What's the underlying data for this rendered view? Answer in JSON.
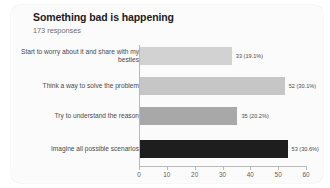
{
  "card": {
    "title": "Something bad is happening",
    "subtitle": "173 responses"
  },
  "chart_data": {
    "type": "bar",
    "orientation": "horizontal",
    "title": "Something bad is happening",
    "subtitle": "173 responses",
    "xlabel": "",
    "ylabel": "",
    "xlim": [
      0,
      60
    ],
    "xticks": [
      "0",
      "10",
      "20",
      "30",
      "40",
      "50",
      "60"
    ],
    "grid": false,
    "legend": false,
    "total_responses": 173,
    "categories": [
      "Start to worry about it and share with my besties",
      "Think a way to solve the problem",
      "Try to understand the reason",
      "Imagine all possible scenarios"
    ],
    "values": [
      33,
      52,
      35,
      53
    ],
    "percents": [
      "19.1%",
      "30.1%",
      "20.2%",
      "30.6%"
    ],
    "data_labels": [
      "33 (19.1%)",
      "52 (30.1%)",
      "35 (20.2%)",
      "53 (30.6%)"
    ],
    "colors": [
      "#d2d2d2",
      "#c6c6c6",
      "#a8a8a8",
      "#1e1e1e"
    ]
  }
}
